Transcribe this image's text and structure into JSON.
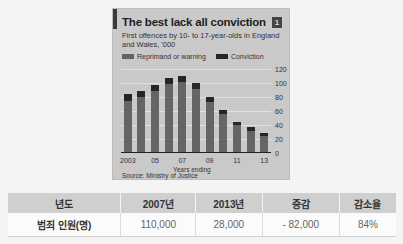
{
  "chart_data": {
    "type": "bar",
    "stacked": true,
    "title": "The best lack all conviction",
    "subtitle": "First offences by 10- to 17-year-olds in England and Wales, '000",
    "badge": "1",
    "xlabel": "Years ending",
    "ylabel": "",
    "source": "Source: Ministry of Justice",
    "ylim": [
      0,
      120
    ],
    "yticks": [
      0,
      20,
      40,
      60,
      80,
      100,
      120
    ],
    "grid": true,
    "legend_position": "top",
    "categories": [
      "2003",
      "2004",
      "2005",
      "2006",
      "2007",
      "2008",
      "2009",
      "2010",
      "2011",
      "2012",
      "2013"
    ],
    "xtick_labels": [
      "2003",
      "05",
      "07",
      "09",
      "11",
      "13"
    ],
    "series": [
      {
        "name": "Reprimand or warning",
        "color": "#656565",
        "values": [
          75,
          80,
          88,
          98,
          101,
          92,
          73,
          56,
          40,
          32,
          24
        ]
      },
      {
        "name": "Conviction",
        "color": "#262626",
        "values": [
          9,
          9,
          9,
          9,
          9,
          8,
          7,
          6,
          5,
          5,
          4
        ]
      }
    ]
  },
  "table": {
    "headers": [
      "년도",
      "2007년",
      "2013년",
      "증감",
      "감소율"
    ],
    "rows": [
      [
        "범죄 인원(명)",
        "110,000",
        "28,000",
        "- 82,000",
        "84%"
      ]
    ]
  }
}
